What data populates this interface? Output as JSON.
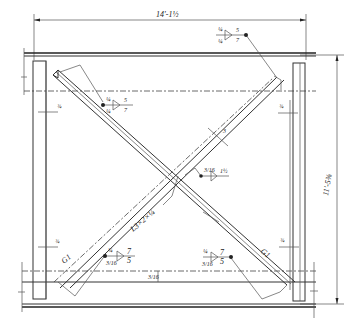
{
  "drawing": {
    "type": "steel cross-bracing connection detail",
    "dimensions": {
      "overall_width": "14'-1 1/2\"",
      "overall_height": "11'-5 3/8\"",
      "brace_member": "L3 x 2 x 1/4",
      "gusset_thickness_mark": "3",
      "edge_offsets": [
        "3/4",
        "3/4",
        "3/4",
        "3/4"
      ],
      "lower_beam_offset": "3/16"
    },
    "weld_callouts": [
      {
        "id": "top-right",
        "sizes": [
          "1/4",
          "1/4"
        ],
        "length_pitch": [
          "5",
          "7"
        ]
      },
      {
        "id": "upper-left",
        "sizes": [
          "1/4",
          "1/4"
        ],
        "length_pitch": [
          "5",
          "7"
        ]
      },
      {
        "id": "center",
        "sizes": [
          "3/16"
        ],
        "length_pitch": [
          "1 1/2"
        ]
      },
      {
        "id": "lower-left",
        "sizes": [
          "1/4",
          "3/16"
        ],
        "length_pitch": [
          "7",
          "5"
        ]
      },
      {
        "id": "lower-right",
        "sizes": [
          "1/4",
          "3/16"
        ],
        "length_pitch": [
          "7",
          "5"
        ]
      }
    ],
    "labels": {
      "dim_width": "14'-1½",
      "dim_height": "11'-5⅜",
      "brace": "L3×2×¼",
      "gusset_left": "G1",
      "gusset_right": "G1",
      "tick_3": "3",
      "edge_ul": "¾",
      "edge_ur": "¾",
      "edge_ll": "¾",
      "edge_lr": "¾",
      "beam_gap": "3/16",
      "w_tr_a": "¼",
      "w_tr_b": "¼",
      "w_tr_c": "5",
      "w_tr_d": "7",
      "w_ul_a": "¼",
      "w_ul_b": "¼",
      "w_ul_c": "5",
      "w_ul_d": "7",
      "w_c_a": "3/16",
      "w_c_b": "1½",
      "w_ll_a": "¼",
      "w_ll_b": "3/16",
      "w_ll_c": "7",
      "w_ll_d": "5",
      "w_lr_a": "¼",
      "w_lr_b": "3/16",
      "w_lr_c": "7",
      "w_lr_d": "5"
    }
  }
}
